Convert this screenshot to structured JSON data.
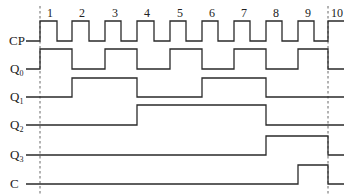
{
  "diagram": {
    "type": "timing-diagram",
    "clock_pulse_numbers": [
      "1",
      "2",
      "3",
      "4",
      "5",
      "6",
      "7",
      "8",
      "9",
      "10"
    ],
    "signals": [
      {
        "name": "CP",
        "label_main": "CP",
        "label_sub": ""
      },
      {
        "name": "Q0",
        "label_main": "Q",
        "label_sub": "0"
      },
      {
        "name": "Q1",
        "label_main": "Q",
        "label_sub": "1"
      },
      {
        "name": "Q2",
        "label_main": "Q",
        "label_sub": "2"
      },
      {
        "name": "Q3",
        "label_main": "Q",
        "label_sub": "3"
      },
      {
        "name": "C",
        "label_main": "C",
        "label_sub": ""
      }
    ],
    "waveforms": {
      "CP": "0 1 0 1 0 1 0 1 0 1 0 1 0 1 0 1 0 1 0 1",
      "Q0": "0 1 0 1 0 1 0 1 0 1 0",
      "Q1": "0 0 1 1 0 0 1 1 0 0 0",
      "Q2": "0 0 0 0 1 1 1 1 0 0 0",
      "Q3": "0 0 0 0 0 0 0 0 1 1 0",
      "C": "0 0 0 0 0 0 0 0 0 1 0"
    },
    "reference_lines": [
      "start",
      "after pulse 10"
    ]
  }
}
